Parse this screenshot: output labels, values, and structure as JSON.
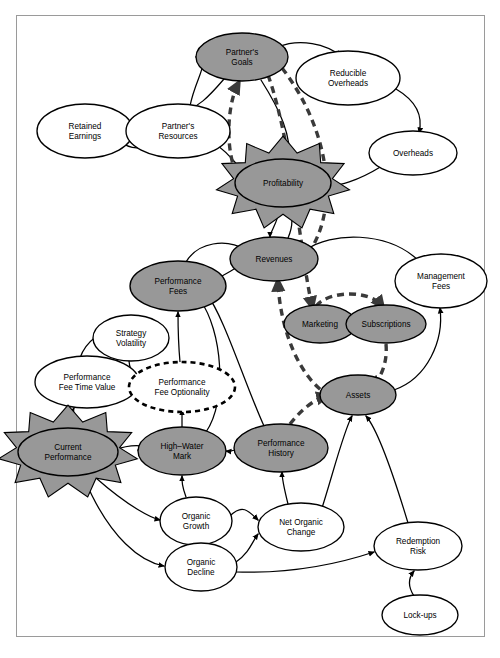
{
  "diagram": {
    "type": "causal-loop-diagram",
    "colors": {
      "node_fill_shaded": "#989898",
      "node_fill_plain": "#ffffff",
      "node_stroke": "#000000",
      "edge_solid": "#000000",
      "edge_dashed": "#3a3a3a",
      "burst_fill": "#989898",
      "frame_border": "#9a9a9a",
      "background": "#ffffff"
    },
    "nodes": [
      {
        "id": "retained_earnings",
        "label": "Retained\nEarnings",
        "lines": [
          "Retained",
          "Earnings"
        ],
        "x": 85,
        "y": 131,
        "rx": 48,
        "ry": 27,
        "style": "plain"
      },
      {
        "id": "partners_resources",
        "label": "Partner's\nResources",
        "lines": [
          "Partner's",
          "Resources"
        ],
        "x": 178,
        "y": 131,
        "rx": 52,
        "ry": 27,
        "style": "plain"
      },
      {
        "id": "partners_goals",
        "label": "Partner's\nGoals",
        "lines": [
          "Partner's",
          "Goals"
        ],
        "x": 242,
        "y": 57,
        "rx": 46,
        "ry": 24,
        "style": "shaded"
      },
      {
        "id": "reducible_overheads",
        "label": "Reducible\nOverheads",
        "lines": [
          "Reducible",
          "Overheads"
        ],
        "x": 348,
        "y": 78,
        "rx": 52,
        "ry": 27,
        "style": "plain"
      },
      {
        "id": "overheads",
        "label": "Overheads",
        "lines": [
          "Overheads"
        ],
        "x": 413,
        "y": 153,
        "rx": 44,
        "ry": 22,
        "style": "plain"
      },
      {
        "id": "profitability",
        "label": "Profitability",
        "lines": [
          "Profitability"
        ],
        "x": 283,
        "y": 183,
        "rx": 48,
        "ry": 24,
        "style": "shaded",
        "burst": true
      },
      {
        "id": "revenues",
        "label": "Revenues",
        "lines": [
          "Revenues"
        ],
        "x": 274,
        "y": 259,
        "rx": 44,
        "ry": 22,
        "style": "shaded"
      },
      {
        "id": "management_fees",
        "label": "Management\nFees",
        "lines": [
          "Management",
          "Fees"
        ],
        "x": 441,
        "y": 281,
        "rx": 46,
        "ry": 27,
        "style": "plain"
      },
      {
        "id": "performance_fees",
        "label": "Performance\nFees",
        "lines": [
          "Performance",
          "Fees"
        ],
        "x": 178,
        "y": 286,
        "rx": 48,
        "ry": 25,
        "style": "shaded"
      },
      {
        "id": "marketing",
        "label": "Marketing",
        "lines": [
          "Marketing"
        ],
        "x": 320,
        "y": 324,
        "rx": 36,
        "ry": 19,
        "style": "shaded"
      },
      {
        "id": "subscriptions",
        "label": "Subscriptions",
        "lines": [
          "Subscriptions"
        ],
        "x": 386,
        "y": 324,
        "rx": 40,
        "ry": 19,
        "style": "shaded"
      },
      {
        "id": "strategy_volatility",
        "label": "Strategy\nVolatility",
        "lines": [
          "Strategy",
          "Volatility"
        ],
        "x": 131,
        "y": 338,
        "rx": 38,
        "ry": 23,
        "style": "plain"
      },
      {
        "id": "performance_fee_time_value",
        "label": "Performance\nFee Time Value",
        "lines": [
          "Performance",
          "Fee Time Value"
        ],
        "x": 87,
        "y": 382,
        "rx": 52,
        "ry": 26,
        "style": "plain"
      },
      {
        "id": "performance_fee_optionality",
        "label": "Performance\nFee Optionality",
        "lines": [
          "Performance",
          "Fee Optionality"
        ],
        "x": 182,
        "y": 387,
        "rx": 53,
        "ry": 25,
        "style": "dashed"
      },
      {
        "id": "assets",
        "label": "Assets",
        "lines": [
          "Assets"
        ],
        "x": 358,
        "y": 395,
        "rx": 38,
        "ry": 20,
        "style": "shaded"
      },
      {
        "id": "current_performance",
        "label": "Current\nPerformance",
        "lines": [
          "Current",
          "Performance"
        ],
        "x": 68,
        "y": 452,
        "rx": 50,
        "ry": 24,
        "style": "shaded",
        "burst": true
      },
      {
        "id": "high_water_mark",
        "label": "High–Water\nMark",
        "lines": [
          "High–Water",
          "Mark"
        ],
        "x": 182,
        "y": 451,
        "rx": 44,
        "ry": 24,
        "style": "shaded"
      },
      {
        "id": "performance_history",
        "label": "Performance\nHistory",
        "lines": [
          "Performance",
          "History"
        ],
        "x": 281,
        "y": 448,
        "rx": 47,
        "ry": 24,
        "style": "shaded"
      },
      {
        "id": "organic_growth",
        "label": "Organic\nGrowth",
        "lines": [
          "Organic",
          "Growth"
        ],
        "x": 196,
        "y": 521,
        "rx": 36,
        "ry": 24,
        "style": "plain"
      },
      {
        "id": "net_organic_change",
        "label": "Net Organic\nChange",
        "lines": [
          "Net Organic",
          "Change"
        ],
        "x": 301,
        "y": 527,
        "rx": 43,
        "ry": 24,
        "style": "plain"
      },
      {
        "id": "organic_decline",
        "label": "Organic\nDecline",
        "lines": [
          "Organic",
          "Decline"
        ],
        "x": 201,
        "y": 567,
        "rx": 36,
        "ry": 24,
        "style": "plain"
      },
      {
        "id": "redemption_risk",
        "label": "Redemption\nRisk",
        "lines": [
          "Redemption",
          "Risk"
        ],
        "x": 418,
        "y": 546,
        "rx": 44,
        "ry": 24,
        "style": "plain"
      },
      {
        "id": "lock_ups",
        "label": "Lock-ups",
        "lines": [
          "Lock-ups"
        ],
        "x": 420,
        "y": 615,
        "rx": 38,
        "ry": 20,
        "style": "plain"
      }
    ],
    "edges": [
      {
        "from": "partners_resources",
        "to": "partners_goals",
        "style": "solid",
        "path": "M 190,106 C 196,76 212,60 196,57"
      },
      {
        "from": "partners_goals",
        "to": "partners_resources",
        "style": "solid",
        "path": "M 224,79 C 206,100 198,106 188,110"
      },
      {
        "from": "partners_resources",
        "to": "retained_earnings",
        "style": "solid",
        "path": "M 127,126 C 118,112 104,112 96,120"
      },
      {
        "from": "retained_earnings",
        "to": "partners_resources",
        "style": "solid",
        "path": "M 120,141 C 132,152 148,148 156,140"
      },
      {
        "from": "partners_goals",
        "to": "reducible_overheads",
        "style": "solid",
        "path": "M 278,47 C 300,38 326,44 341,56"
      },
      {
        "from": "reducible_overheads",
        "to": "overheads",
        "style": "solid",
        "path": "M 396,89 C 418,102 423,117 419,133"
      },
      {
        "from": "overheads",
        "to": "profitability",
        "style": "solid",
        "path": "M 382,166 C 356,182 338,186 330,185"
      },
      {
        "from": "partners_goals",
        "to": "profitability",
        "style": "solid",
        "path": "M 261,80 C 280,110 292,136 289,162"
      },
      {
        "from": "profitability",
        "to": "partners_resources",
        "style": "solid",
        "path": "M 243,172 C 228,152 214,142 206,137"
      },
      {
        "from": "profitability",
        "to": "partners_goals",
        "style": "dashed",
        "path": "M 250,193 C 222,170 226,106 238,84"
      },
      {
        "from": "partners_goals",
        "to": "marketing",
        "style": "dashed",
        "path": "M 268,75 C 292,142 300,252 312,306"
      },
      {
        "from": "partners_goals",
        "to": "revenues",
        "style": "dashed",
        "path": "M 282,68 C 330,130 344,216 300,264"
      },
      {
        "from": "profitability",
        "to": "revenues",
        "style": "solid",
        "path": "M 280,208 C 278,222 270,232 270,237"
      },
      {
        "from": "revenues",
        "to": "profitability",
        "style": "solid",
        "path": "M 288,238 C 294,224 292,214 288,208"
      },
      {
        "from": "performance_fees",
        "to": "revenues",
        "style": "solid",
        "path": "M 186,262 C 198,242 226,238 246,250"
      },
      {
        "from": "revenues",
        "to": "performance_fees",
        "style": "solid",
        "path": "M 236,268 C 222,276 212,282 204,285"
      },
      {
        "from": "marketing",
        "to": "subscriptions",
        "style": "dashed",
        "path": "M 316,306 C 330,290 370,290 382,306"
      },
      {
        "from": "subscriptions",
        "to": "assets",
        "style": "dashed",
        "path": "M 386,344 C 388,366 378,382 372,386"
      },
      {
        "from": "assets",
        "to": "management_fees",
        "style": "solid",
        "path": "M 394,390 C 428,378 444,340 440,308"
      },
      {
        "from": "management_fees",
        "to": "revenues",
        "style": "solid",
        "path": "M 420,262 C 388,230 330,232 306,250"
      },
      {
        "from": "assets",
        "to": "revenues",
        "style": "dashed",
        "path": "M 330,396 C 300,380 280,330 278,282"
      },
      {
        "from": "performance_history",
        "to": "assets",
        "style": "dashed",
        "path": "M 290,424 C 304,406 318,398 326,396"
      },
      {
        "from": "performance_history",
        "to": "high_water_mark",
        "style": "solid",
        "path": "M 236,450 C 224,452 236,452 226,451"
      },
      {
        "from": "current_performance",
        "to": "high_water_mark",
        "style": "solid",
        "path": "M 114,450 C 130,444 150,444 138,450"
      },
      {
        "from": "current_performance",
        "to": "performance_fee_time_value",
        "style": "solid",
        "path": "M 70,428 C 70,418 72,412 74,408"
      },
      {
        "from": "performance_fee_time_value",
        "to": "strategy_volatility",
        "style": "solid",
        "path": "M 80,358 C 86,340 104,330 112,330"
      },
      {
        "from": "strategy_volatility",
        "to": "performance_fee_optionality",
        "style": "solid",
        "path": "M 129,361 C 130,374 138,382 148,385"
      },
      {
        "from": "performance_fee_time_value",
        "to": "performance_fee_optionality",
        "style": "solid",
        "path": "M 136,388 C 140,388 136,386 138,386"
      },
      {
        "from": "high_water_mark",
        "to": "performance_fee_optionality",
        "style": "solid",
        "path": "M 182,428 C 182,418 182,414 182,410"
      },
      {
        "from": "performance_fee_optionality",
        "to": "performance_fees",
        "style": "solid",
        "path": "M 180,362 C 178,340 178,322 178,312"
      },
      {
        "from": "high_water_mark",
        "to": "performance_fees",
        "style": "solid",
        "path": "M 206,432 C 228,400 222,330 200,300"
      },
      {
        "from": "performance_history",
        "to": "performance_fees",
        "style": "solid",
        "path": "M 264,426 C 244,382 224,316 206,293"
      },
      {
        "from": "current_performance",
        "to": "organic_growth",
        "style": "solid",
        "path": "M 96,478 C 130,508 152,518 160,520"
      },
      {
        "from": "current_performance",
        "to": "organic_decline",
        "style": "solid",
        "path": "M 84,478 C 110,540 142,562 164,566"
      },
      {
        "from": "organic_growth",
        "to": "high_water_mark",
        "style": "solid",
        "path": "M 186,497 C 182,486 182,482 182,476"
      },
      {
        "from": "organic_growth",
        "to": "net_organic_change",
        "style": "solid",
        "path": "M 230,516 C 242,504 248,510 258,520"
      },
      {
        "from": "organic_decline",
        "to": "net_organic_change",
        "style": "solid",
        "path": "M 236,562 C 250,552 252,542 258,534"
      },
      {
        "from": "net_organic_change",
        "to": "performance_history",
        "style": "solid",
        "path": "M 288,504 C 284,488 282,480 282,472"
      },
      {
        "from": "net_organic_change",
        "to": "assets",
        "style": "solid",
        "path": "M 322,508 C 334,470 344,430 352,416"
      },
      {
        "from": "organic_decline",
        "to": "redemption_risk",
        "style": "solid",
        "path": "M 236,572 C 300,574 350,560 374,552"
      },
      {
        "from": "redemption_risk",
        "to": "assets",
        "style": "solid",
        "path": "M 408,523 C 392,470 378,430 366,416"
      },
      {
        "from": "lock_ups",
        "to": "redemption_risk",
        "style": "solid",
        "path": "M 414,596 C 406,584 410,576 414,571"
      }
    ]
  },
  "caption": {
    "text": ""
  }
}
